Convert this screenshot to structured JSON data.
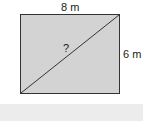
{
  "diagram": {
    "shape": "rectangle",
    "top_label": "8 m",
    "right_label": "6 m",
    "diagonal_label": "?",
    "fill_color": "#d3d3d3",
    "band_color": "#ececec"
  }
}
